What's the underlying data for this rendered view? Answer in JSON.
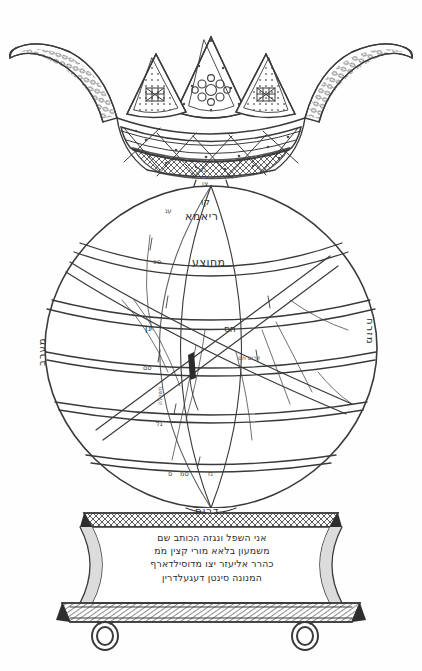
{
  "figure": {
    "ink_color": "#3a3a3a",
    "paper_color": "#fefefe"
  },
  "crown": {
    "name": "ornamented crown with five points and outward curling side plumes",
    "band_label": "נזר",
    "neck_label": "צו"
  },
  "globe": {
    "labels": {
      "north_cap": "קו",
      "upper_zone": "ריאמא",
      "equator": "מחוצע",
      "mid_left": "נן",
      "mid_right": "חס",
      "band_right": "דרום חם",
      "west": "מערב",
      "east": "מזרח",
      "south": "דרום",
      "diagonal_left": "חשכלה"
    },
    "tick_labels": {
      "t1": "ענ",
      "t2": "ספ",
      "t3": "סם",
      "t4": "גל",
      "t5": "ס",
      "t6": "סמ",
      "t7": "נז"
    }
  },
  "pedestal": {
    "inscription_lines": [
      "אני השפל ונגזה הכותב שם",
      "משמעון בלאא מורי קצין מֹמ",
      "כהרר אליעזר יצו מדוסילדארף",
      "המנונה סינטן דעגעלדרין"
    ],
    "feet": "two ring feet"
  }
}
